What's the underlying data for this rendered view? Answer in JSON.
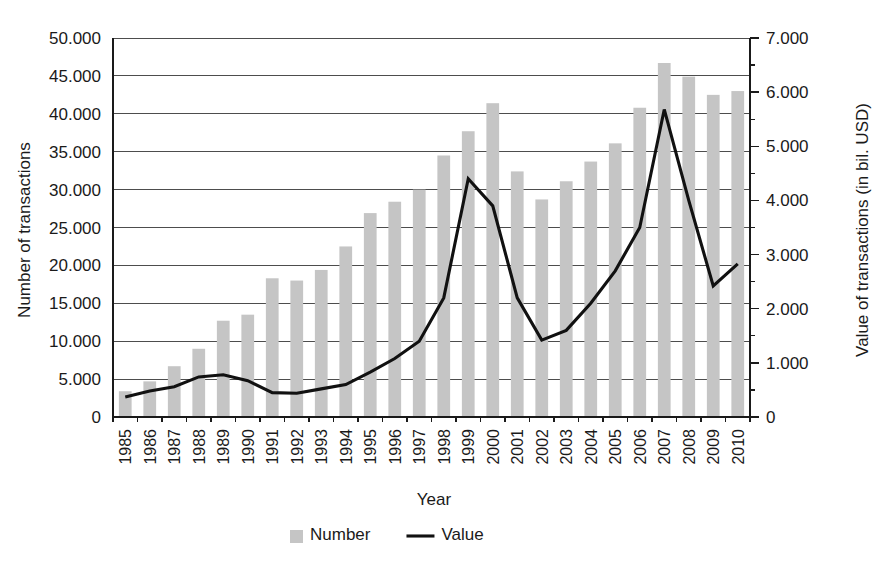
{
  "chart_data": {
    "type": "bar",
    "title": "",
    "subtitle": "",
    "xlabel": "Year",
    "ylabel": "Number of transactions",
    "y2label": "Value of transactions (in bil. USD)",
    "grid": true,
    "legend_position": "bottom",
    "categories": [
      "1985",
      "1986",
      "1987",
      "1988",
      "1989",
      "1990",
      "1991",
      "1992",
      "1993",
      "1994",
      "1995",
      "1996",
      "1997",
      "1998",
      "1999",
      "2000",
      "2001",
      "2002",
      "2003",
      "2004",
      "2005",
      "2006",
      "2007",
      "2008",
      "2009",
      "2010"
    ],
    "ylim": [
      0,
      50000
    ],
    "y2lim": [
      0,
      7000
    ],
    "yticks": [
      0,
      5000,
      10000,
      15000,
      20000,
      25000,
      30000,
      35000,
      40000,
      45000,
      50000
    ],
    "ytick_labels": [
      "0",
      "5.000",
      "10.000",
      "15.000",
      "20.000",
      "25.000",
      "30.000",
      "35.000",
      "40.000",
      "45.000",
      "50.000"
    ],
    "y2ticks": [
      0,
      1000,
      2000,
      3000,
      4000,
      5000,
      6000,
      7000
    ],
    "y2tick_labels": [
      "0",
      "1.000",
      "2.000",
      "3.000",
      "4.000",
      "5.000",
      "6.000",
      "7.000"
    ],
    "y2_minor_tick_step": 500,
    "series": [
      {
        "name": "Number",
        "type": "bar",
        "axis": "left",
        "color": "#c5c5c5",
        "values": [
          3400,
          4700,
          6700,
          9000,
          12700,
          13500,
          18300,
          18000,
          19400,
          22500,
          26900,
          28400,
          30000,
          34500,
          37700,
          41400,
          32400,
          28700,
          31100,
          33700,
          36100,
          40800,
          46700,
          44900,
          42500,
          43000
        ]
      },
      {
        "name": "Value",
        "type": "line",
        "axis": "right",
        "color": "#111111",
        "values": [
          370,
          480,
          560,
          740,
          780,
          670,
          450,
          440,
          520,
          600,
          830,
          1080,
          1400,
          2200,
          4400,
          3900,
          2200,
          1420,
          1600,
          2100,
          2700,
          3500,
          5680,
          4000,
          2420,
          2830
        ]
      }
    ],
    "legend": [
      {
        "label": "Number",
        "marker": "square",
        "color": "#c5c5c5"
      },
      {
        "label": "Value",
        "marker": "line",
        "color": "#111111"
      }
    ]
  }
}
